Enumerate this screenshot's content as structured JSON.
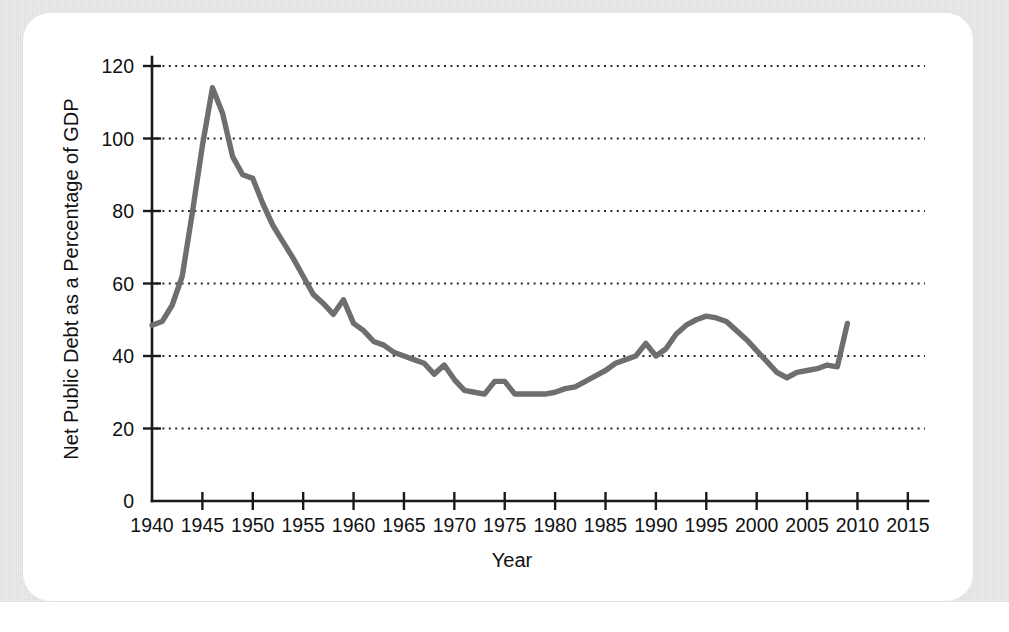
{
  "figure": {
    "background_color": "#ededed",
    "card_color": "#ffffff",
    "line_color": "#6e6e6e",
    "axis_color": "#1a1a1a"
  },
  "chart_data": {
    "type": "line",
    "title": "",
    "xlabel": "Year",
    "ylabel": "Net Public Debt as a Percentage of GDP",
    "xlim": [
      1940,
      2017
    ],
    "ylim": [
      0,
      124
    ],
    "grid": "horizontal-dotted",
    "legend": "none",
    "xticks": [
      1940,
      1945,
      1950,
      1955,
      1960,
      1965,
      1970,
      1975,
      1980,
      1985,
      1990,
      1995,
      2000,
      2005,
      2010,
      2015
    ],
    "xtick_labels": [
      "1940",
      "1945",
      "1950",
      "1955",
      "1960",
      "1965",
      "1970",
      "1975",
      "1980",
      "1985",
      "1990",
      "1995",
      "2000",
      "2005",
      "2010",
      "2015"
    ],
    "yticks": [
      0,
      20,
      40,
      60,
      80,
      100,
      120
    ],
    "ytick_labels": [
      "0",
      "20",
      "40",
      "60",
      "80",
      "100",
      "120"
    ],
    "series": [
      {
        "name": "Net Public Debt as a Percentage of GDP",
        "color": "#6e6e6e",
        "x": [
          1940,
          1941,
          1942,
          1943,
          1944,
          1945,
          1946,
          1947,
          1948,
          1949,
          1950,
          1951,
          1952,
          1953,
          1954,
          1955,
          1956,
          1957,
          1958,
          1959,
          1960,
          1961,
          1962,
          1963,
          1964,
          1965,
          1966,
          1967,
          1968,
          1969,
          1970,
          1971,
          1972,
          1973,
          1974,
          1975,
          1976,
          1977,
          1978,
          1979,
          1980,
          1981,
          1982,
          1983,
          1984,
          1985,
          1986,
          1987,
          1988,
          1989,
          1990,
          1991,
          1992,
          1993,
          1994,
          1995,
          1996,
          1997,
          1998,
          1999,
          2000,
          2001,
          2002,
          2003,
          2004,
          2005,
          2006,
          2007,
          2008,
          2009
        ],
        "y": [
          48.5,
          49.5,
          54.0,
          62.0,
          79.5,
          98.0,
          114.0,
          107.0,
          95.0,
          90.0,
          89.0,
          82.0,
          76.0,
          71.5,
          67.0,
          62.0,
          57.0,
          54.5,
          51.5,
          55.5,
          49.0,
          47.0,
          44.0,
          43.0,
          41.0,
          40.0,
          39.0,
          38.0,
          35.0,
          37.5,
          33.5,
          30.5,
          30.0,
          29.5,
          33.0,
          33.0,
          29.5,
          29.5,
          29.5,
          29.5,
          30.0,
          31.0,
          31.5,
          33.0,
          34.5,
          36.0,
          38.0,
          39.0,
          40.0,
          43.5,
          40.0,
          42.0,
          46.0,
          48.5,
          50.0,
          51.0,
          50.5,
          49.5,
          47.0,
          44.5,
          41.5,
          38.5,
          35.5,
          34.0,
          35.5,
          36.0,
          36.5,
          37.5,
          37.0,
          49.0
        ]
      }
    ]
  }
}
